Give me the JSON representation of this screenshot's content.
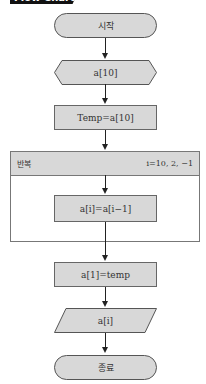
{
  "header": {
    "label": "Flow Chart"
  },
  "flowchart": {
    "start": "시작",
    "prep": "a[10]",
    "assign_temp": "Temp=a[10]",
    "loop": {
      "label": "반복",
      "range": "i=10, 2, −1"
    },
    "loop_body": "a[i]=a[i−1]",
    "assign_first": "a[1]=temp",
    "output": "a[i]",
    "end": "종료"
  },
  "colors": {
    "fill": "#d8d8d8",
    "stroke": "#555555",
    "header_bg": "#111111"
  }
}
